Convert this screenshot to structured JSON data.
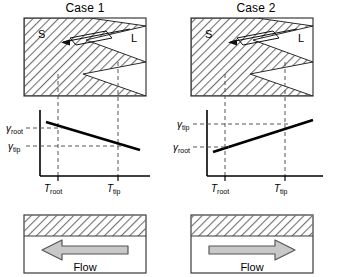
{
  "figure": {
    "type": "schematic-diagram"
  },
  "panels": [
    {
      "id": "case-1",
      "title": "Case 1",
      "microstructure": {
        "solid_label": "S",
        "liquid_label": "L",
        "channel_marker": "parallelogram-outline",
        "dendrite_arms": 3
      },
      "graph": {
        "y_labels": {
          "upper": "γ",
          "upper_sub": "root",
          "lower": "γ",
          "lower_sub": "tip"
        },
        "x_labels": {
          "left": "T",
          "left_sub": "root",
          "right": "T",
          "right_sub": "tip"
        },
        "trend": "decreasing",
        "y_upper_value": 0.8,
        "y_lower_value": 0.38,
        "x_root_value": 0.27,
        "x_tip_value": 0.74
      },
      "flow": {
        "label": "Flow",
        "direction": "left",
        "arrow_glyph": "left-arrow"
      }
    },
    {
      "id": "case-2",
      "title": "Case 2",
      "microstructure": {
        "solid_label": "S",
        "liquid_label": "L",
        "channel_marker": "parallelogram-outline",
        "dendrite_arms": 3
      },
      "graph": {
        "y_labels": {
          "upper": "γ",
          "upper_sub": "tip",
          "lower": "γ",
          "lower_sub": "root"
        },
        "x_labels": {
          "left": "T",
          "left_sub": "root",
          "right": "T",
          "right_sub": "tip"
        },
        "trend": "increasing",
        "y_upper_value": 0.8,
        "y_lower_value": 0.38,
        "x_root_value": 0.27,
        "x_tip_value": 0.74
      },
      "flow": {
        "label": "Flow",
        "direction": "right",
        "arrow_glyph": "right-arrow"
      }
    }
  ],
  "colors": {
    "line": "#000000",
    "hatch": "#707070",
    "dashed": "#555555",
    "arrow_fill": "#c8c8c8",
    "arrow_stroke": "#555555",
    "border": "#3a3a3a"
  }
}
